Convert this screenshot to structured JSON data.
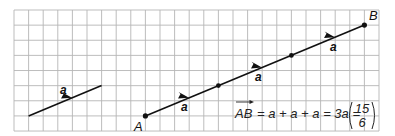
{
  "diagram": {
    "grid": {
      "x0": 14,
      "y0": 10,
      "cols": 25,
      "rows": 8,
      "cell_w": 14.6,
      "cell_h": 15.13,
      "line_color": "#b5b5b5"
    },
    "vector_a": {
      "label": "a",
      "from": [
        1,
        7
      ],
      "to": [
        6,
        5
      ],
      "components": [
        5,
        2
      ]
    },
    "path": {
      "start_label": "A",
      "end_label": "B",
      "points": [
        [
          9,
          7
        ],
        [
          14,
          5
        ],
        [
          19,
          3
        ],
        [
          24,
          1
        ]
      ],
      "segment_labels": [
        "a",
        "a",
        "a"
      ]
    },
    "equation": {
      "lhs": "AB",
      "rhs_sum": "= a + a + a = 3a =",
      "column_top": "15",
      "column_bottom": "6"
    },
    "colors": {
      "ink": "#111111",
      "background": "#ffffff"
    }
  }
}
